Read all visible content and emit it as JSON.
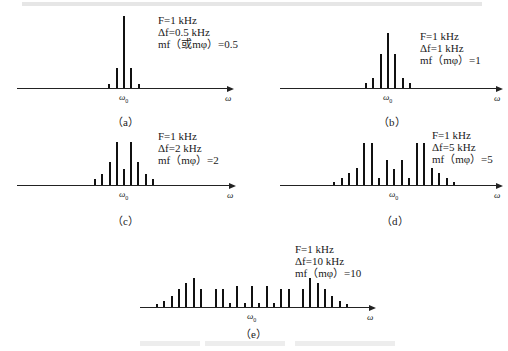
{
  "header_text": "",
  "caption_text": "",
  "axis": {
    "center_label": "ω",
    "center_sub": "0",
    "end_label": "ω"
  },
  "panels": [
    {
      "tag": "（a）",
      "F": "F=1 kHz",
      "df": "Δf=0.5 kHz",
      "m": "mf（或mφ）=0.5"
    },
    {
      "tag": "（b）",
      "F": "F=1 kHz",
      "df": "Δf=1 kHz",
      "m": "mf（mφ）=1"
    },
    {
      "tag": "（c）",
      "F": "F=1 kHz",
      "df": "Δf=2 kHz",
      "m": "mf（mφ）=2"
    },
    {
      "tag": "（d）",
      "F": "F=1 kHz",
      "df": "Δf=5 kHz",
      "m": "mf（mφ）=5"
    },
    {
      "tag": "（e）",
      "F": "F=1 kHz",
      "df": "Δf=10 kHz",
      "m": "mf（mφ）=10"
    }
  ],
  "chart_data": [
    {
      "type": "bar",
      "title": "(a)",
      "xlabel": "ω",
      "center": "ω0",
      "annotations": [
        "F=1 kHz",
        "Δf=0.5 kHz",
        "mf (mφ) = 0.5"
      ],
      "categories": [
        -2,
        -1,
        0,
        1,
        2
      ],
      "values": [
        4,
        20,
        72,
        20,
        4
      ]
    },
    {
      "type": "bar",
      "title": "(b)",
      "xlabel": "ω",
      "center": "ω0",
      "annotations": [
        "F=1 kHz",
        "Δf=1 kHz",
        "mf (mφ) = 1"
      ],
      "categories": [
        -3,
        -2,
        -1,
        0,
        1,
        2,
        3
      ],
      "values": [
        5,
        10,
        34,
        55,
        34,
        10,
        5
      ]
    },
    {
      "type": "bar",
      "title": "(c)",
      "xlabel": "ω",
      "center": "ω0",
      "annotations": [
        "F=1 kHz",
        "Δf=2 kHz",
        "mf (mφ) = 2"
      ],
      "categories": [
        -4,
        -3,
        -2,
        -1,
        0,
        1,
        2,
        3,
        4
      ],
      "values": [
        6,
        11,
        23,
        43,
        16,
        43,
        23,
        11,
        6
      ]
    },
    {
      "type": "bar",
      "title": "(d)",
      "xlabel": "ω",
      "center": "ω0",
      "annotations": [
        "F=1 kHz",
        "Δf=5 kHz",
        "mf (mφ) = 5"
      ],
      "categories": [
        -8,
        -7,
        -6,
        -5,
        -4,
        -3,
        -2,
        -1,
        0,
        1,
        2,
        3,
        4,
        5,
        6,
        7,
        8
      ],
      "values": [
        3,
        7,
        12,
        17,
        42,
        42,
        7,
        25,
        16,
        25,
        7,
        42,
        42,
        17,
        12,
        7,
        3
      ]
    },
    {
      "type": "bar",
      "title": "(e)",
      "xlabel": "ω",
      "center": "ω0",
      "annotations": [
        "F=1 kHz",
        "Δf=10 kHz",
        "mf (mφ) = 10"
      ],
      "categories": [
        -13,
        -12,
        -11,
        -10,
        -9,
        -8,
        -7,
        -6,
        -5,
        -4,
        -3,
        -2,
        -1,
        0,
        1,
        2,
        3,
        4,
        5,
        6,
        7,
        8,
        9,
        10,
        11,
        12,
        13
      ],
      "values": [
        3,
        6,
        11,
        18,
        24,
        29,
        18,
        0,
        18,
        18,
        4,
        21,
        4,
        21,
        4,
        21,
        4,
        18,
        18,
        0,
        18,
        29,
        24,
        18,
        11,
        6,
        3
      ]
    }
  ],
  "layout": {
    "panels": [
      {
        "x0": 17,
        "x1": 228,
        "y": 88,
        "cx": 124,
        "step": 7.3,
        "tagX": 112,
        "tagY": 113,
        "pX": 158,
        "pY": 14
      },
      {
        "x0": 280,
        "x1": 497,
        "y": 88,
        "cx": 388,
        "step": 7.4,
        "tagX": 378,
        "tagY": 113,
        "pX": 420,
        "pY": 30
      },
      {
        "x0": 17,
        "x1": 230,
        "y": 185,
        "cx": 124,
        "step": 7.2,
        "tagX": 112,
        "tagY": 212,
        "pX": 158,
        "pY": 130
      },
      {
        "x0": 280,
        "x1": 497,
        "y": 185,
        "cx": 394,
        "step": 7.5,
        "tagX": 381,
        "tagY": 212,
        "pX": 432,
        "pY": 129
      },
      {
        "x0": 140,
        "x1": 370,
        "y": 307,
        "cx": 252,
        "step": 7.3,
        "tagX": 240,
        "tagY": 325,
        "pX": 295,
        "pY": 243
      }
    ]
  }
}
